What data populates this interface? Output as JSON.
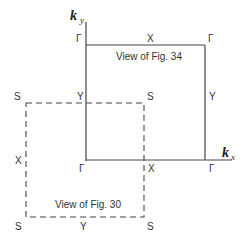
{
  "axes": {
    "y_label": "k",
    "y_sub": "y",
    "x_label": "k",
    "x_sub": "x"
  },
  "solid_box": {
    "caption": "View of Fig. 34",
    "labels": {
      "top_left": "Γ",
      "top_mid": "X",
      "top_right": "Γ",
      "mid_left": "Y",
      "mid_right": "Y",
      "bot_left": "Γ",
      "bot_mid": "X",
      "bot_right": "Γ"
    }
  },
  "dashed_box": {
    "caption": "View of Fig. 30",
    "labels": {
      "top_left": "S",
      "top_right": "S",
      "mid_left": "X",
      "bot_left": "S",
      "bot_mid": "Y",
      "bot_right": "S"
    }
  },
  "colors": {
    "line": "#444444",
    "text": "#333333"
  }
}
